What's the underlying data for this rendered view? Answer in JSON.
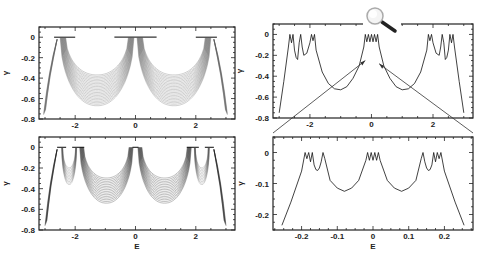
{
  "chart_data": [
    {
      "id": "top-left",
      "type": "line",
      "description": "Family of many shaded curves (dense band) of gamma vs E",
      "xlabel": "",
      "ylabel": "γ",
      "xlim": [
        -3.2,
        3.3
      ],
      "ylim": [
        -0.8,
        0.1
      ],
      "xticks": [
        -2,
        0,
        2
      ],
      "xtick_labels": [
        "-2",
        "0",
        "2"
      ],
      "yticks": [
        0,
        -0.2,
        -0.4,
        -0.6,
        -0.8
      ],
      "ytick_labels": [
        "0",
        "-0.2",
        "-0.4",
        "-0.6",
        "-0.8"
      ],
      "flat_segments_at_zero": [
        [
          -2.7,
          -2.0
        ],
        [
          -0.7,
          0.7
        ],
        [
          2.0,
          2.7
        ]
      ],
      "band_minima": [
        {
          "x": -1.45,
          "y_top": -0.4,
          "y_bottom": -0.67
        },
        {
          "x": 1.45,
          "y_top": -0.4,
          "y_bottom": -0.67
        }
      ],
      "band_shade": "#888888"
    },
    {
      "id": "bottom-left",
      "type": "line",
      "description": "Family of many shaded curves (dense band) of gamma vs E",
      "xlabel": "E",
      "ylabel": "γ",
      "xlim": [
        -3.2,
        3.3
      ],
      "ylim": [
        -0.8,
        0.1
      ],
      "xticks": [
        -2,
        0,
        2
      ],
      "xtick_labels": [
        "-2",
        "0",
        "2"
      ],
      "yticks": [
        0,
        -0.2,
        -0.4,
        -0.6,
        -0.8
      ],
      "ytick_labels": [
        "0",
        "-0.2",
        "-0.4",
        "-0.6",
        "-0.8"
      ],
      "flat_segments_at_zero": [
        [
          -2.6,
          -2.3
        ],
        [
          -2.1,
          -1.7
        ],
        [
          -0.1,
          0.1
        ],
        [
          1.7,
          2.1
        ],
        [
          2.3,
          2.6
        ]
      ],
      "band_minima": [
        {
          "x": -2.2,
          "y": -0.36
        },
        {
          "x": -1.0,
          "y": -0.53
        },
        {
          "x": 1.0,
          "y": -0.53
        },
        {
          "x": 2.2,
          "y": -0.36
        }
      ],
      "band_shade": "#333333"
    },
    {
      "id": "top-right",
      "type": "line",
      "xlabel": "",
      "ylabel": "γ",
      "xlim": [
        -3.2,
        3.3
      ],
      "ylim": [
        -0.8,
        0.1
      ],
      "xticks": [
        -2,
        0,
        2
      ],
      "xtick_labels": [
        "-2",
        "0",
        "2"
      ],
      "yticks": [
        0,
        -0.2,
        -0.4,
        -0.6,
        -0.8
      ],
      "ytick_labels": [
        "0",
        "-0.2",
        "-0.4",
        "-0.6",
        "-0.8"
      ],
      "series": [
        {
          "name": "gamma(E)",
          "x": [
            -3.0,
            -2.85,
            -2.7,
            -2.65,
            -2.6,
            -2.55,
            -2.5,
            -2.45,
            -2.4,
            -2.35,
            -2.3,
            -2.25,
            -2.2,
            -2.1,
            -2.0,
            -1.95,
            -1.9,
            -1.85,
            -1.8,
            -1.6,
            -1.4,
            -1.2,
            -1.0,
            -0.8,
            -0.6,
            -0.4,
            -0.25,
            -0.2,
            -0.15,
            -0.1,
            -0.05,
            0.0,
            0.05,
            0.1,
            0.15,
            0.2,
            0.25,
            0.4,
            0.6,
            0.8,
            1.0,
            1.2,
            1.4,
            1.6,
            1.8,
            1.85,
            1.9,
            1.95,
            2.0,
            2.1,
            2.2,
            2.25,
            2.3,
            2.35,
            2.4,
            2.45,
            2.5,
            2.55,
            2.6,
            2.65,
            2.7,
            2.85,
            3.0
          ],
          "y": [
            -0.75,
            -0.45,
            -0.12,
            0.0,
            -0.08,
            0.0,
            -0.15,
            -0.22,
            -0.24,
            -0.08,
            0.0,
            -0.12,
            -0.2,
            -0.18,
            -0.08,
            0.0,
            -0.06,
            0.0,
            -0.15,
            -0.36,
            -0.47,
            -0.52,
            -0.53,
            -0.5,
            -0.42,
            -0.3,
            -0.12,
            0.0,
            -0.07,
            0.0,
            -0.07,
            0.0,
            -0.07,
            0.0,
            -0.07,
            0.0,
            -0.12,
            -0.3,
            -0.42,
            -0.5,
            -0.53,
            -0.52,
            -0.47,
            -0.36,
            -0.15,
            0.0,
            -0.06,
            0.0,
            -0.08,
            -0.18,
            -0.2,
            -0.12,
            0.0,
            -0.08,
            -0.24,
            -0.22,
            -0.15,
            0.0,
            -0.08,
            0.0,
            -0.12,
            -0.45,
            -0.75
          ]
        }
      ],
      "annotation": {
        "type": "magnifier-icon",
        "meaning": "zoom into central region",
        "arrows_to": "bottom-right panel"
      }
    },
    {
      "id": "bottom-right",
      "type": "line",
      "xlabel": "E",
      "ylabel": "γ",
      "xlim": [
        -0.28,
        0.28
      ],
      "ylim": [
        -0.25,
        0.05
      ],
      "xticks": [
        -0.2,
        -0.1,
        0,
        0.1,
        0.2
      ],
      "xtick_labels": [
        "-0.2",
        "-0.1",
        "0",
        "0.1",
        "0.2"
      ],
      "yticks": [
        0,
        -0.1,
        -0.2
      ],
      "ytick_labels": [
        "0",
        "-0.1",
        "-0.2"
      ],
      "series": [
        {
          "name": "gamma(E) zoom",
          "x": [
            -0.255,
            -0.23,
            -0.2,
            -0.19,
            -0.185,
            -0.18,
            -0.175,
            -0.17,
            -0.165,
            -0.16,
            -0.155,
            -0.15,
            -0.145,
            -0.14,
            -0.135,
            -0.12,
            -0.1,
            -0.08,
            -0.06,
            -0.04,
            -0.02,
            -0.015,
            -0.01,
            -0.005,
            0.0,
            0.005,
            0.01,
            0.015,
            0.02,
            0.04,
            0.06,
            0.08,
            0.1,
            0.12,
            0.135,
            0.14,
            0.145,
            0.15,
            0.155,
            0.16,
            0.165,
            0.17,
            0.175,
            0.18,
            0.185,
            0.19,
            0.2,
            0.23,
            0.255
          ],
          "y": [
            -0.235,
            -0.16,
            -0.06,
            0.0,
            -0.02,
            0.0,
            -0.03,
            0.0,
            -0.04,
            -0.055,
            -0.058,
            -0.05,
            -0.03,
            0.0,
            -0.02,
            -0.09,
            -0.115,
            -0.125,
            -0.115,
            -0.09,
            -0.025,
            0.0,
            -0.025,
            0.0,
            -0.025,
            0.0,
            -0.025,
            0.0,
            -0.025,
            -0.09,
            -0.115,
            -0.125,
            -0.115,
            -0.09,
            -0.02,
            0.0,
            -0.03,
            -0.05,
            -0.058,
            -0.055,
            -0.04,
            0.0,
            -0.03,
            0.0,
            -0.02,
            0.0,
            -0.06,
            -0.16,
            -0.235
          ]
        }
      ]
    }
  ]
}
